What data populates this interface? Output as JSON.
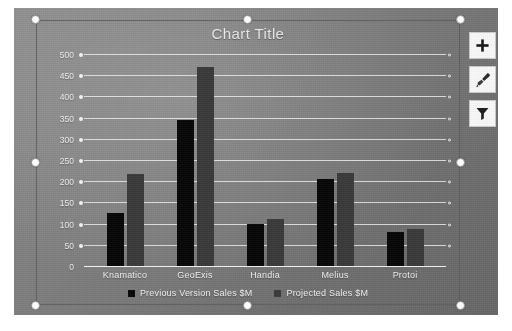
{
  "slide": {
    "background_color": "#7a7a7a"
  },
  "chart": {
    "title": "Chart Title",
    "selected": true,
    "series_colors": [
      "#080808",
      "#3a3a3a"
    ]
  },
  "chart_data": {
    "type": "bar",
    "title": "Chart Title",
    "xlabel": "",
    "ylabel": "",
    "ylim": [
      0,
      500
    ],
    "ytick_step": 50,
    "grid": true,
    "legend_position": "bottom",
    "categories": [
      "Knamatico",
      "GeoExis",
      "Handia",
      "Melius",
      "Protoi"
    ],
    "yticks": [
      0,
      50,
      100,
      150,
      200,
      250,
      300,
      350,
      400,
      450,
      500
    ],
    "series": [
      {
        "name": "Previous Version Sales $M",
        "color": "#080808",
        "values": [
          125,
          345,
          100,
          205,
          80
        ]
      },
      {
        "name": "Projected Sales $M",
        "color": "#3a3a3a",
        "values": [
          218,
          470,
          110,
          220,
          87
        ]
      }
    ]
  },
  "buttons": [
    {
      "name": "chart-elements-button",
      "icon": "plus-icon",
      "label": "Chart Elements"
    },
    {
      "name": "chart-styles-button",
      "icon": "paintbrush-icon",
      "label": "Chart Styles"
    },
    {
      "name": "chart-filters-button",
      "icon": "funnel-icon",
      "label": "Chart Filters"
    }
  ]
}
